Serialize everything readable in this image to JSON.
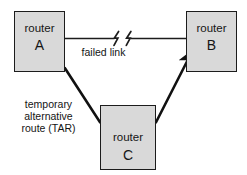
{
  "diagram": {
    "canvas": {
      "width": 247,
      "height": 175,
      "background": "#ffffff"
    },
    "style": {
      "node_fill": "#d9d9d9",
      "node_stroke": "#1c1c1c",
      "failed_link_stroke": "#1c1c1c",
      "tar_stroke": "#111111",
      "text_color": "#141414"
    },
    "nodes": [
      {
        "id": "A",
        "name": "router-a",
        "kind_label": "router",
        "ident_label": "A",
        "x": 14,
        "y": 11,
        "w": 51,
        "h": 61
      },
      {
        "id": "B",
        "name": "router-b",
        "kind_label": "router",
        "ident_label": "B",
        "x": 186,
        "y": 11,
        "w": 51,
        "h": 61
      },
      {
        "id": "C",
        "name": "router-c",
        "kind_label": "router",
        "ident_label": "C",
        "x": 100,
        "y": 105,
        "w": 56,
        "h": 65
      }
    ],
    "links": [
      {
        "id": "a-b",
        "name": "failed-link",
        "from": "A",
        "to": "B",
        "state": "failed",
        "label": "failed link",
        "break_symbol": "lightning-zigzag",
        "break_count": 2
      },
      {
        "id": "a-c-b",
        "name": "temporary-alternative-route",
        "from": "A",
        "via": "C",
        "to": "B",
        "state": "active",
        "directed": true,
        "label_lines": [
          "temporary",
          "alternative",
          "route (TAR)"
        ],
        "label_text": "temporary alternative route (TAR)",
        "abbreviation": "TAR"
      }
    ]
  }
}
